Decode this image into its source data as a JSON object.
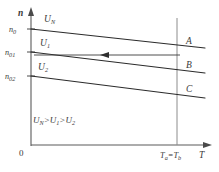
{
  "figure": {
    "background_color": "#ffffff",
    "line_color": "#2b2b2b",
    "axis_color": "#5a5a5a",
    "guide_color": "#8c8c8c"
  },
  "axes": {
    "y_label": "n",
    "x_label": "T",
    "origin_label": "0"
  },
  "y_ticks": [
    {
      "label": "n",
      "sub": "0",
      "y": 29
    },
    {
      "label": "n",
      "sub": "01",
      "y": 52
    },
    {
      "label": "n",
      "sub": "02",
      "y": 76
    }
  ],
  "x_marker": {
    "label_a": "T",
    "sub_a": "a",
    "equals": "=",
    "label_b": "T",
    "sub_b": "b"
  },
  "curves": [
    {
      "name": "curve-UN",
      "voltage_label": "U",
      "voltage_sub": "N",
      "end_label": "A",
      "x1": 31,
      "y1": 29,
      "x2": 205,
      "y2": 48
    },
    {
      "name": "curve-U1",
      "voltage_label": "U",
      "voltage_sub": "1",
      "end_label": "B",
      "x1": 31,
      "y1": 52,
      "x2": 205,
      "y2": 73
    },
    {
      "name": "curve-U2",
      "voltage_label": "U",
      "voltage_sub": "2",
      "end_label": "C",
      "x1": 31,
      "y1": 76,
      "x2": 205,
      "y2": 98
    }
  ],
  "annotation": {
    "inequality_u": "U",
    "inequality_sub_n": "N",
    "inequality_gt1": ">U",
    "inequality_sub_1": "1",
    "inequality_gt2": ">U",
    "inequality_sub_2": "2",
    "full_text": "U_N > U_1 > U_2"
  },
  "direction_arrow": {
    "name": "decreasing-voltage-arrow",
    "from_x": 180,
    "to_x": 103,
    "y": 55,
    "direction": "left"
  }
}
